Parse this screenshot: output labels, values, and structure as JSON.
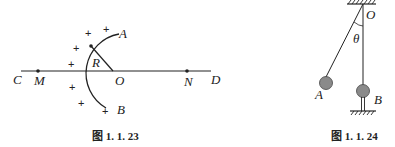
{
  "figure_left": {
    "caption": "图 1. 1. 23",
    "labels": {
      "A": "A",
      "B": "B",
      "C": "C",
      "D": "D",
      "M": "M",
      "N": "N",
      "O": "O",
      "R": "R"
    },
    "charges": [
      "+",
      "+",
      "+",
      "+",
      "+",
      "+",
      "+",
      "+"
    ]
  },
  "figure_right": {
    "caption": "图 1. 1. 24",
    "labels": {
      "O": "O",
      "theta": "θ",
      "A": "A",
      "B": "B"
    }
  },
  "colors": {
    "line": "#222222",
    "ball": "#8a8a8a"
  }
}
